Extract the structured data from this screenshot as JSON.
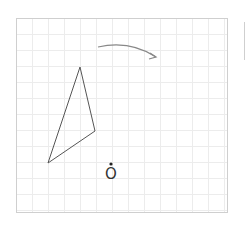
{
  "diagram": {
    "type": "rotation-diagram",
    "grid": {
      "x": 16,
      "y": 18,
      "width": 211,
      "height": 194,
      "cell": 16,
      "line_color": "#ececec",
      "border_color": "#cfcfcf"
    },
    "shape": {
      "name": "triangle",
      "vertices": [
        [
          80,
          67
        ],
        [
          95,
          131
        ],
        [
          48,
          163
        ]
      ],
      "stroke": "#555555"
    },
    "arrow": {
      "direction": "clockwise",
      "start": [
        98,
        47
      ],
      "control": [
        130,
        40
      ],
      "end": [
        156,
        57
      ],
      "stroke": "#888888"
    },
    "center_point": {
      "label": "O",
      "dot": [
        111,
        164
      ],
      "label_pos": [
        105,
        167
      ]
    }
  }
}
